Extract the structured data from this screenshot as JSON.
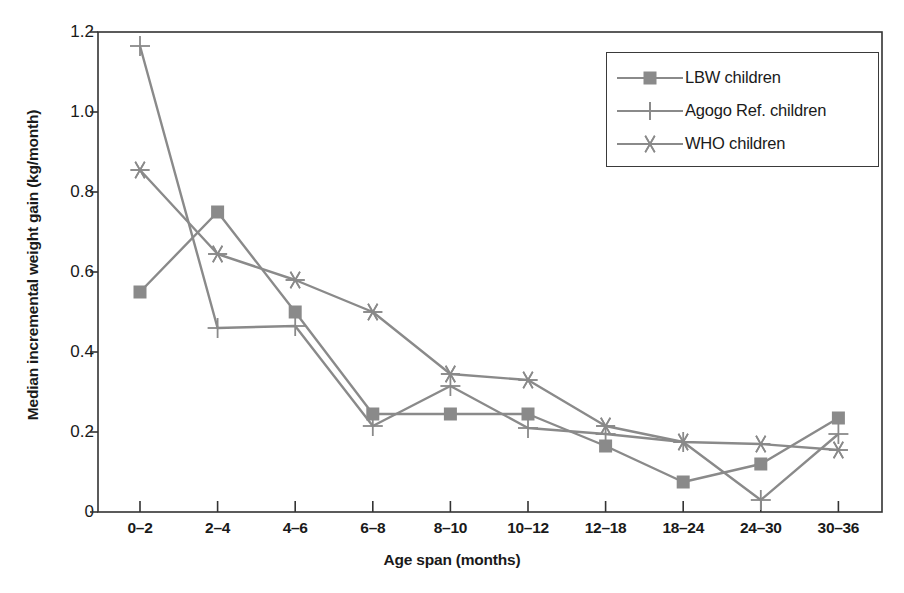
{
  "chart_data": {
    "type": "line",
    "title": "",
    "xlabel": "Age span (months)",
    "ylabel": "Median incremental weight gain (kg/month)",
    "categories": [
      "0–2",
      "2–4",
      "4–6",
      "6–8",
      "8–10",
      "10–12",
      "12–18",
      "18–24",
      "24–30",
      "30–36"
    ],
    "x_tick_labels": [
      "0–2",
      "2–4",
      "4–6",
      "6–8",
      "8–10",
      "10–12",
      "12–18",
      "18–24",
      "24–30",
      "30–36"
    ],
    "y_tick_labels": [
      "0",
      "0.2",
      "0.4",
      "0.6",
      "0.8",
      "1.0",
      "1.2"
    ],
    "y_tick_values": [
      0,
      0.2,
      0.4,
      0.6,
      0.8,
      1.0,
      1.2
    ],
    "ylim": [
      0,
      1.2
    ],
    "grid": false,
    "legend_position": "top-right",
    "series": [
      {
        "name": "LBW children",
        "marker": "square",
        "color": "#8a8a8a",
        "values": [
          0.55,
          0.75,
          0.5,
          0.245,
          0.245,
          0.245,
          0.165,
          0.075,
          0.12,
          0.235
        ]
      },
      {
        "name": "Agogo Ref. children",
        "marker": "plus",
        "color": "#8a8a8a",
        "values": [
          1.165,
          0.46,
          0.465,
          0.215,
          0.315,
          0.21,
          0.195,
          0.175,
          0.03,
          0.195
        ]
      },
      {
        "name": "WHO children",
        "marker": "star",
        "color": "#8a8a8a",
        "values": [
          0.855,
          0.645,
          0.58,
          0.5,
          0.345,
          0.33,
          0.215,
          0.175,
          0.17,
          0.155
        ]
      }
    ]
  },
  "legend": {
    "items": [
      {
        "label": "LBW children",
        "marker": "square"
      },
      {
        "label": "Agogo Ref. children",
        "marker": "plus"
      },
      {
        "label": "WHO children",
        "marker": "star"
      }
    ]
  },
  "axes": {
    "frame_color": "#333333",
    "line_color": "#8a8a8a"
  }
}
